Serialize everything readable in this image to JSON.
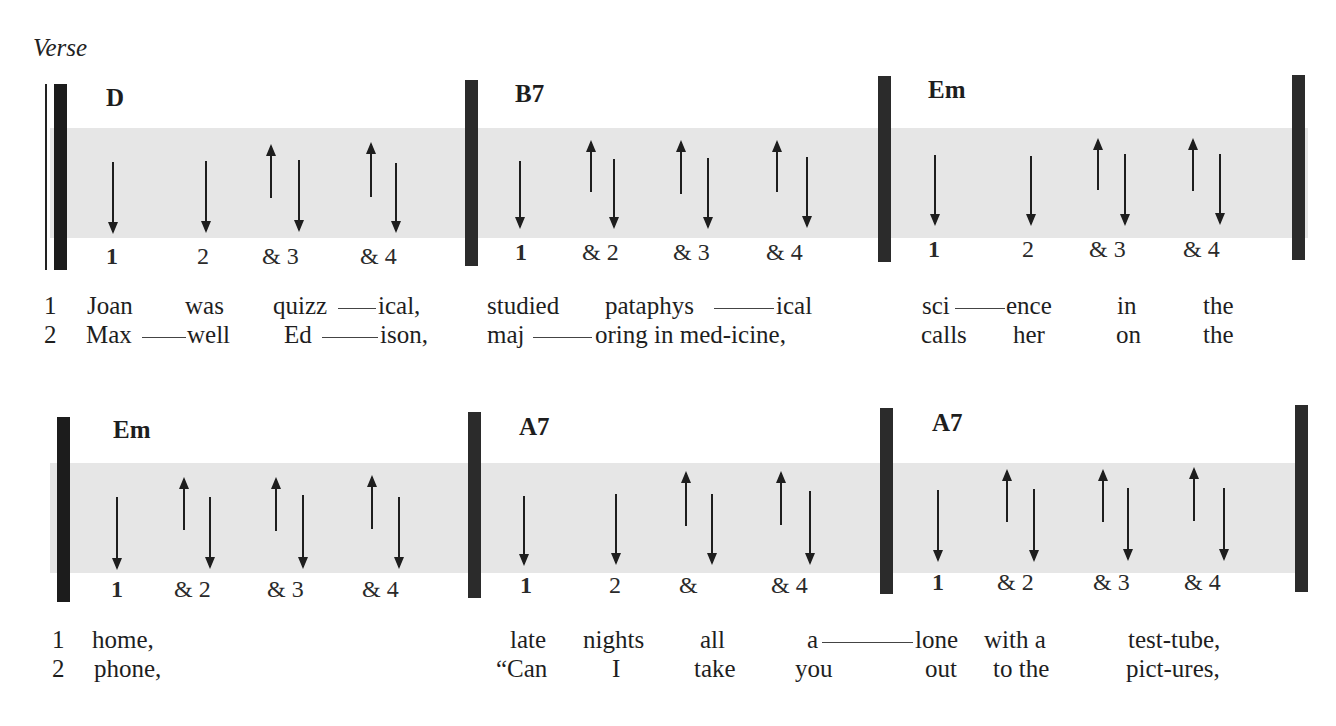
{
  "section_label": "Verse",
  "colors": {
    "band": "#e6e6e6",
    "bar": "#1c1c1c",
    "ink": "#1e1e1e"
  },
  "rows": [
    {
      "band": {
        "x": 50,
        "y": 128,
        "w": 1258,
        "h": 110
      },
      "bars": [
        {
          "x": 54,
          "top": 84,
          "bottom": 270,
          "thin_left_x": 45
        },
        {
          "x": 465,
          "top": 80,
          "bottom": 266
        },
        {
          "x": 878,
          "top": 76,
          "bottom": 262
        },
        {
          "x": 1292,
          "top": 75,
          "bottom": 260
        }
      ],
      "measures": [
        {
          "chord": "D",
          "chord_x": 106,
          "chord_y": 84,
          "count_y": 243,
          "counts": [
            {
              "text": "1",
              "x": 106,
              "bold": true
            },
            {
              "text": "2",
              "x": 197
            },
            {
              "text": "& 3",
              "x": 262
            },
            {
              "text": "& 4",
              "x": 360
            }
          ],
          "strokes": [
            {
              "dir": "down",
              "x": 112,
              "top": 162,
              "bottom": 232
            },
            {
              "dir": "down",
              "x": 205,
              "top": 161,
              "bottom": 231
            },
            {
              "dir": "up",
              "x": 270,
              "top": 146,
              "bottom": 198
            },
            {
              "dir": "down",
              "x": 298,
              "top": 160,
              "bottom": 230
            },
            {
              "dir": "up",
              "x": 370,
              "top": 144,
              "bottom": 197
            },
            {
              "dir": "down",
              "x": 395,
              "top": 163,
              "bottom": 231
            }
          ]
        },
        {
          "chord": "B7",
          "chord_x": 515,
          "chord_y": 80,
          "count_y": 239,
          "counts": [
            {
              "text": "1",
              "x": 515,
              "bold": true
            },
            {
              "text": "& 2",
              "x": 582
            },
            {
              "text": "& 3",
              "x": 673
            },
            {
              "text": "& 4",
              "x": 766
            }
          ],
          "strokes": [
            {
              "dir": "down",
              "x": 519,
              "top": 161,
              "bottom": 227
            },
            {
              "dir": "up",
              "x": 590,
              "top": 142,
              "bottom": 192
            },
            {
              "dir": "down",
              "x": 613,
              "top": 159,
              "bottom": 227
            },
            {
              "dir": "up",
              "x": 680,
              "top": 142,
              "bottom": 194
            },
            {
              "dir": "down",
              "x": 707,
              "top": 158,
              "bottom": 227
            },
            {
              "dir": "up",
              "x": 776,
              "top": 142,
              "bottom": 192
            },
            {
              "dir": "down",
              "x": 806,
              "top": 157,
              "bottom": 226
            }
          ]
        },
        {
          "chord": "Em",
          "chord_x": 928,
          "chord_y": 76,
          "count_y": 236,
          "counts": [
            {
              "text": "1",
              "x": 928,
              "bold": true
            },
            {
              "text": "2",
              "x": 1022
            },
            {
              "text": "& 3",
              "x": 1089
            },
            {
              "text": "& 4",
              "x": 1183
            }
          ],
          "strokes": [
            {
              "dir": "down",
              "x": 934,
              "top": 155,
              "bottom": 224
            },
            {
              "dir": "down",
              "x": 1030,
              "top": 156,
              "bottom": 224
            },
            {
              "dir": "up",
              "x": 1097,
              "top": 140,
              "bottom": 190
            },
            {
              "dir": "down",
              "x": 1124,
              "top": 154,
              "bottom": 224
            },
            {
              "dir": "up",
              "x": 1192,
              "top": 140,
              "bottom": 191
            },
            {
              "dir": "down",
              "x": 1219,
              "top": 154,
              "bottom": 223
            }
          ]
        }
      ],
      "lyrics": [
        {
          "y": 292,
          "words": [
            {
              "text": "1",
              "x": 44
            },
            {
              "text": "Joan",
              "x": 87
            },
            {
              "text": "was",
              "x": 185
            },
            {
              "text": "quizz",
              "x": 273
            },
            {
              "text": "ical,",
              "x": 378
            },
            {
              "text": "studied",
              "x": 487
            },
            {
              "text": "pataphys",
              "x": 605
            },
            {
              "text": "ical",
              "x": 776
            },
            {
              "text": "sci",
              "x": 922
            },
            {
              "text": "ence",
              "x": 1006
            },
            {
              "text": "in",
              "x": 1117
            },
            {
              "text": "the",
              "x": 1203
            }
          ],
          "ties": [
            {
              "x1": 338,
              "x2": 376
            },
            {
              "x1": 714,
              "x2": 774
            },
            {
              "x1": 955,
              "x2": 1005
            }
          ]
        },
        {
          "y": 321,
          "words": [
            {
              "text": "2",
              "x": 44
            },
            {
              "text": "Max",
              "x": 86
            },
            {
              "text": "well",
              "x": 187
            },
            {
              "text": "Ed",
              "x": 284
            },
            {
              "text": "ison,",
              "x": 380
            },
            {
              "text": "maj",
              "x": 487
            },
            {
              "text": "oring in med-icine,",
              "x": 595
            },
            {
              "text": "calls",
              "x": 921
            },
            {
              "text": "her",
              "x": 1013
            },
            {
              "text": "on",
              "x": 1116
            },
            {
              "text": "the",
              "x": 1203
            }
          ],
          "ties": [
            {
              "x1": 142,
              "x2": 186
            },
            {
              "x1": 322,
              "x2": 378
            },
            {
              "x1": 533,
              "x2": 592
            }
          ]
        }
      ]
    },
    {
      "band": {
        "x": 50,
        "y": 463,
        "w": 1258,
        "h": 110
      },
      "bars": [
        {
          "x": 57,
          "top": 417,
          "bottom": 602
        },
        {
          "x": 468,
          "top": 412,
          "bottom": 598
        },
        {
          "x": 880,
          "top": 408,
          "bottom": 594
        },
        {
          "x": 1295,
          "top": 405,
          "bottom": 592
        }
      ],
      "measures": [
        {
          "chord": "Em",
          "chord_x": 113,
          "chord_y": 416,
          "count_y": 576,
          "counts": [
            {
              "text": "1",
              "x": 111,
              "bold": true
            },
            {
              "text": "& 2",
              "x": 174
            },
            {
              "text": "& 3",
              "x": 267
            },
            {
              "text": "& 4",
              "x": 362
            }
          ],
          "strokes": [
            {
              "dir": "down",
              "x": 116,
              "top": 497,
              "bottom": 568
            },
            {
              "dir": "up",
              "x": 183,
              "top": 479,
              "bottom": 530
            },
            {
              "dir": "down",
              "x": 209,
              "top": 497,
              "bottom": 567
            },
            {
              "dir": "up",
              "x": 275,
              "top": 479,
              "bottom": 531
            },
            {
              "dir": "down",
              "x": 302,
              "top": 495,
              "bottom": 567
            },
            {
              "dir": "up",
              "x": 371,
              "top": 477,
              "bottom": 529
            },
            {
              "dir": "down",
              "x": 398,
              "top": 497,
              "bottom": 567
            }
          ]
        },
        {
          "chord": "A7",
          "chord_x": 519,
          "chord_y": 413,
          "count_y": 572,
          "counts": [
            {
              "text": "1",
              "x": 520,
              "bold": true
            },
            {
              "text": "2",
              "x": 609
            },
            {
              "text": "&",
              "x": 679
            },
            {
              "text": "& 4",
              "x": 771
            }
          ],
          "strokes": [
            {
              "dir": "down",
              "x": 523,
              "top": 496,
              "bottom": 564
            },
            {
              "dir": "down",
              "x": 615,
              "top": 494,
              "bottom": 563
            },
            {
              "dir": "up",
              "x": 685,
              "top": 473,
              "bottom": 526
            },
            {
              "dir": "down",
              "x": 711,
              "top": 494,
              "bottom": 563
            },
            {
              "dir": "up",
              "x": 780,
              "top": 473,
              "bottom": 525
            },
            {
              "dir": "down",
              "x": 809,
              "top": 491,
              "bottom": 563
            }
          ]
        },
        {
          "chord": "A7",
          "chord_x": 932,
          "chord_y": 409,
          "count_y": 569,
          "counts": [
            {
              "text": "1",
              "x": 932,
              "bold": true
            },
            {
              "text": "& 2",
              "x": 997
            },
            {
              "text": "& 3",
              "x": 1093
            },
            {
              "text": "& 4",
              "x": 1184
            }
          ],
          "strokes": [
            {
              "dir": "down",
              "x": 937,
              "top": 490,
              "bottom": 560
            },
            {
              "dir": "up",
              "x": 1006,
              "top": 471,
              "bottom": 522
            },
            {
              "dir": "down",
              "x": 1033,
              "top": 489,
              "bottom": 560
            },
            {
              "dir": "up",
              "x": 1102,
              "top": 471,
              "bottom": 522
            },
            {
              "dir": "down",
              "x": 1127,
              "top": 488,
              "bottom": 559
            },
            {
              "dir": "up",
              "x": 1193,
              "top": 469,
              "bottom": 521
            },
            {
              "dir": "down",
              "x": 1223,
              "top": 488,
              "bottom": 559
            }
          ]
        }
      ],
      "lyrics": [
        {
          "y": 626,
          "words": [
            {
              "text": "1",
              "x": 52
            },
            {
              "text": "home,",
              "x": 92
            },
            {
              "text": "late",
              "x": 510
            },
            {
              "text": "nights",
              "x": 583
            },
            {
              "text": "all",
              "x": 700
            },
            {
              "text": "a",
              "x": 807
            },
            {
              "text": "lone",
              "x": 915
            },
            {
              "text": "with a",
              "x": 984
            },
            {
              "text": "test-tube,",
              "x": 1128
            }
          ],
          "ties": [
            {
              "x1": 822,
              "x2": 913
            }
          ]
        },
        {
          "y": 655,
          "words": [
            {
              "text": "2",
              "x": 52
            },
            {
              "text": "phone,",
              "x": 94
            },
            {
              "text": "“Can",
              "x": 496
            },
            {
              "text": "I",
              "x": 612
            },
            {
              "text": "take",
              "x": 694
            },
            {
              "text": "you",
              "x": 795
            },
            {
              "text": "out",
              "x": 925
            },
            {
              "text": "to the",
              "x": 993
            },
            {
              "text": "pict-ures,",
              "x": 1126
            }
          ],
          "ties": []
        }
      ]
    }
  ]
}
